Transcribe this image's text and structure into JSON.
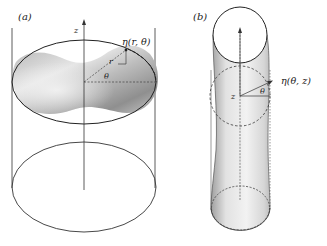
{
  "panels": [
    {
      "id": "a",
      "label": "(a)",
      "axis_label": "z",
      "surface_label": "η(r, θ)",
      "radius_label": "r",
      "angle_label": "θ"
    },
    {
      "id": "b",
      "label": "(b)",
      "axis_label": "z",
      "surface_label": "η(θ, z)",
      "angle_label": "θ"
    }
  ],
  "colors": {
    "line": "#2b2b2b",
    "surface_dark": "#9a9a9a",
    "surface_light": "#efefef"
  }
}
